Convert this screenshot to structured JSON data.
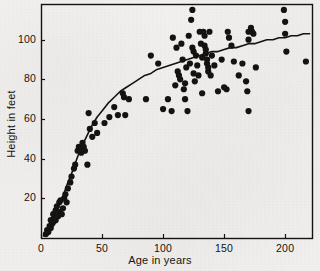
{
  "figure": {
    "background_color": "#f2f0ee",
    "ink_color": "#151310",
    "width": 320,
    "height": 271
  },
  "chart_data": {
    "type": "scatter",
    "title": "",
    "xlabel": "Age in years",
    "ylabel": "Height in feet",
    "xlim": [
      0,
      222
    ],
    "ylim": [
      0,
      118
    ],
    "xticks": [
      0,
      50,
      100,
      150,
      200
    ],
    "xtick_labels": [
      "0",
      "50",
      "100",
      "150",
      "200"
    ],
    "yticks": [
      20,
      40,
      60,
      80,
      100
    ],
    "ytick_labels": [
      "20",
      "40",
      "60",
      "80",
      "100"
    ],
    "grid": false,
    "legend": null,
    "frame": "box",
    "marker": {
      "shape": "circle",
      "color": "#151310",
      "size": 3.1
    },
    "series": [
      {
        "name": "Observed trees",
        "type": "scatter",
        "points": [
          [
            4,
            2
          ],
          [
            5,
            4
          ],
          [
            6,
            3
          ],
          [
            7,
            6
          ],
          [
            8,
            5
          ],
          [
            8,
            9
          ],
          [
            9,
            7
          ],
          [
            10,
            12
          ],
          [
            10,
            8
          ],
          [
            11,
            10
          ],
          [
            12,
            14
          ],
          [
            12,
            9
          ],
          [
            13,
            16
          ],
          [
            14,
            11
          ],
          [
            15,
            18
          ],
          [
            15,
            13
          ],
          [
            16,
            19
          ],
          [
            17,
            12
          ],
          [
            18,
            15
          ],
          [
            19,
            20
          ],
          [
            20,
            22
          ],
          [
            21,
            18
          ],
          [
            22,
            25
          ],
          [
            24,
            28
          ],
          [
            25,
            31
          ],
          [
            27,
            35
          ],
          [
            28,
            37
          ],
          [
            30,
            44
          ],
          [
            31,
            46
          ],
          [
            32,
            45
          ],
          [
            33,
            43
          ],
          [
            34,
            48
          ],
          [
            35,
            46
          ],
          [
            36,
            44
          ],
          [
            38,
            37
          ],
          [
            39,
            63
          ],
          [
            40,
            55
          ],
          [
            42,
            51
          ],
          [
            44,
            58
          ],
          [
            46,
            53
          ],
          [
            52,
            58
          ],
          [
            56,
            61
          ],
          [
            60,
            66
          ],
          [
            63,
            62
          ],
          [
            67,
            73
          ],
          [
            68,
            71
          ],
          [
            69,
            62
          ],
          [
            72,
            70
          ],
          [
            86,
            70
          ],
          [
            90,
            92
          ],
          [
            96,
            88
          ],
          [
            100,
            65
          ],
          [
            104,
            70
          ],
          [
            107,
            64
          ],
          [
            108,
            101
          ],
          [
            110,
            77
          ],
          [
            111,
            96
          ],
          [
            112,
            84
          ],
          [
            113,
            82
          ],
          [
            114,
            80
          ],
          [
            115,
            98
          ],
          [
            116,
            90
          ],
          [
            117,
            75
          ],
          [
            118,
            78
          ],
          [
            118,
            70
          ],
          [
            119,
            86
          ],
          [
            120,
            64
          ],
          [
            121,
            102
          ],
          [
            122,
            88
          ],
          [
            123,
            110
          ],
          [
            124,
            115
          ],
          [
            124,
            96
          ],
          [
            125,
            94
          ],
          [
            125,
            83
          ],
          [
            126,
            79
          ],
          [
            127,
            92
          ],
          [
            128,
            87
          ],
          [
            129,
            82
          ],
          [
            130,
            104
          ],
          [
            131,
            98
          ],
          [
            132,
            91
          ],
          [
            132,
            73
          ],
          [
            133,
            104
          ],
          [
            134,
            102
          ],
          [
            134,
            97
          ],
          [
            135,
            95
          ],
          [
            135,
            93
          ],
          [
            136,
            90
          ],
          [
            136,
            88
          ],
          [
            137,
            86
          ],
          [
            137,
            84
          ],
          [
            138,
            104
          ],
          [
            139,
            82
          ],
          [
            140,
            92
          ],
          [
            142,
            87
          ],
          [
            145,
            74
          ],
          [
            148,
            90
          ],
          [
            150,
            76
          ],
          [
            152,
            75
          ],
          [
            153,
            104
          ],
          [
            154,
            101
          ],
          [
            156,
            97
          ],
          [
            158,
            89
          ],
          [
            162,
            82
          ],
          [
            165,
            88
          ],
          [
            168,
            79
          ],
          [
            169,
            74
          ],
          [
            170,
            104
          ],
          [
            170,
            100
          ],
          [
            170,
            64
          ],
          [
            172,
            106
          ],
          [
            173,
            104
          ],
          [
            174,
            103
          ],
          [
            176,
            86
          ],
          [
            199,
            115
          ],
          [
            200,
            109
          ],
          [
            200,
            103
          ],
          [
            201,
            94
          ],
          [
            217,
            89
          ]
        ]
      },
      {
        "name": "Fitted growth curve",
        "type": "line",
        "color": "#151310",
        "width": 1.6,
        "points": [
          [
            2,
            1
          ],
          [
            6,
            5
          ],
          [
            10,
            10
          ],
          [
            14,
            15
          ],
          [
            18,
            21
          ],
          [
            22,
            28
          ],
          [
            26,
            34
          ],
          [
            30,
            41
          ],
          [
            34,
            47
          ],
          [
            38,
            52
          ],
          [
            42,
            57
          ],
          [
            46,
            61
          ],
          [
            50,
            64
          ],
          [
            55,
            68
          ],
          [
            60,
            71
          ],
          [
            65,
            74
          ],
          [
            70,
            76
          ],
          [
            75,
            78
          ],
          [
            80,
            80
          ],
          [
            85,
            82
          ],
          [
            90,
            83
          ],
          [
            95,
            85
          ],
          [
            100,
            86
          ],
          [
            105,
            87
          ],
          [
            110,
            88
          ],
          [
            115,
            89
          ],
          [
            120,
            90
          ],
          [
            125,
            91
          ],
          [
            130,
            92
          ],
          [
            135,
            93
          ],
          [
            140,
            94
          ],
          [
            145,
            94
          ],
          [
            150,
            95
          ],
          [
            155,
            96
          ],
          [
            160,
            96
          ],
          [
            165,
            97
          ],
          [
            170,
            98
          ],
          [
            175,
            98
          ],
          [
            180,
            99
          ],
          [
            185,
            100
          ],
          [
            190,
            100
          ],
          [
            195,
            101
          ],
          [
            200,
            101
          ],
          [
            205,
            102
          ],
          [
            210,
            102
          ],
          [
            215,
            103
          ],
          [
            220,
            103
          ]
        ]
      }
    ]
  }
}
